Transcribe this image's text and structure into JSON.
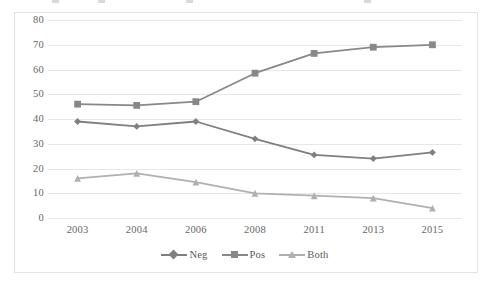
{
  "chart_data": {
    "type": "line",
    "title": "",
    "subtitle": "",
    "xlabel": "",
    "ylabel": "",
    "categories": [
      "2003",
      "2004",
      "2006",
      "2008",
      "2011",
      "2013",
      "2015"
    ],
    "ylim": [
      0,
      80
    ],
    "ytick_labels": [
      "0",
      "10",
      "20",
      "30",
      "40",
      "50",
      "60",
      "70",
      "80"
    ],
    "ytick_values": [
      0,
      10,
      20,
      30,
      40,
      50,
      60,
      70,
      80
    ],
    "grid": "horizontal",
    "legend_position": "bottom",
    "series": [
      {
        "name": "Neg",
        "values": [
          39,
          37,
          39,
          32,
          25.5,
          24,
          26.5
        ],
        "color": "#7f7f7f",
        "marker": "diamond"
      },
      {
        "name": "Pos",
        "values": [
          46,
          45.5,
          47,
          58.5,
          66.5,
          69,
          70
        ],
        "color": "#888888",
        "marker": "square"
      },
      {
        "name": "Both",
        "values": [
          16,
          18,
          14.5,
          10,
          9,
          8,
          4
        ],
        "color": "#b0b0b0",
        "marker": "triangle"
      }
    ]
  },
  "legend": {
    "items": [
      {
        "label": "Neg"
      },
      {
        "label": "Pos"
      },
      {
        "label": "Both"
      }
    ]
  },
  "colors": {
    "neg": "#7f7f7f",
    "pos": "#888888",
    "both": "#b0b0b0",
    "gridline": "#e8e8e8",
    "frame": "#e3e3e3",
    "text": "#666666",
    "background": "#ffffff"
  }
}
